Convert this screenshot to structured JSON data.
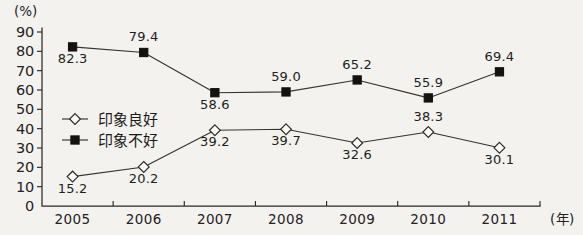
{
  "chart_data": {
    "type": "line",
    "title": "",
    "xlabel": "(年)",
    "ylabel": "(%)",
    "categories": [
      "2005",
      "2006",
      "2007",
      "2008",
      "2009",
      "2010",
      "2011"
    ],
    "ylim": [
      0,
      90
    ],
    "ytick_values": [
      "0",
      "10",
      "20",
      "30",
      "40",
      "50",
      "60",
      "70",
      "80",
      "90"
    ],
    "grid": false,
    "legend_position": "inside-upper-left",
    "series": [
      {
        "name": "印象良好",
        "marker": "open-diamond",
        "values": [
          15.2,
          20.2,
          39.2,
          39.7,
          32.6,
          38.3,
          30.1
        ],
        "labels": [
          "15.2",
          "20.2",
          "39.2",
          "39.7",
          "32.6",
          "38.3",
          "30.1"
        ],
        "label_placement": [
          "below",
          "below",
          "below",
          "below",
          "below",
          "above",
          "below"
        ]
      },
      {
        "name": "印象不好",
        "marker": "filled-square",
        "values": [
          82.3,
          79.4,
          58.6,
          59.0,
          65.2,
          55.9,
          69.4
        ],
        "labels": [
          "82.3",
          "79.4",
          "58.6",
          "59.0",
          "65.2",
          "55.9",
          "69.4"
        ],
        "label_placement": [
          "below",
          "above",
          "below",
          "above",
          "above",
          "above",
          "above"
        ]
      }
    ],
    "colors": {
      "axis": "#2c2926",
      "line": "#37332f",
      "marker_open_fill": "#fbfaf7",
      "marker_filled_fill": "#141210",
      "background": "#f4f2ee",
      "text": "#211e1c"
    }
  },
  "legend": {
    "items": [
      {
        "label": "印象良好",
        "marker": "open-diamond"
      },
      {
        "label": "印象不好",
        "marker": "filled-square"
      }
    ]
  }
}
